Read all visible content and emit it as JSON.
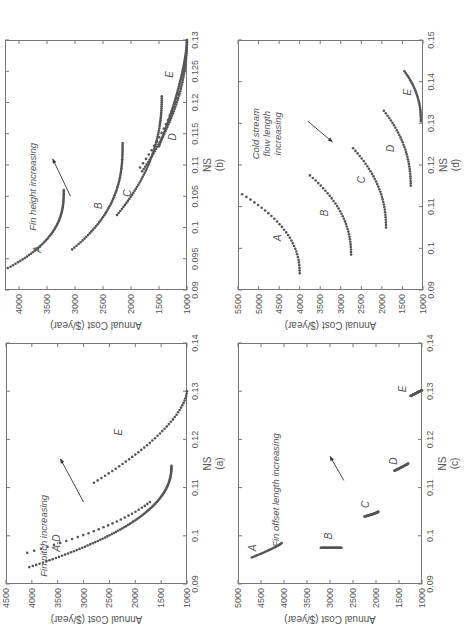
{
  "figure": {
    "rotation": "90deg counter-clockwise (page shown sideways)",
    "panels": [
      "a",
      "b",
      "c",
      "d"
    ]
  },
  "chart_data": [
    {
      "id": "a",
      "type": "scatter",
      "caption": "(a)",
      "xlabel": "NS",
      "ylabel": "Annual Cost ($/year)",
      "xlim": [
        0.09,
        0.14
      ],
      "ylim": [
        1000,
        4500
      ],
      "xticks": [
        "0.09",
        "0.1",
        "0.11",
        "0.12",
        "0.13",
        "0.14"
      ],
      "xtick_values": [
        0.09,
        0.1,
        0.11,
        0.12,
        0.13,
        0.14
      ],
      "yticks": [
        "1000",
        "1500",
        "2000",
        "2500",
        "3000",
        "3500",
        "4000",
        "4500"
      ],
      "ytick_values": [
        1000,
        1500,
        2000,
        2500,
        3000,
        3500,
        4000,
        4500
      ],
      "annotation": {
        "text": "Fin pitch increasing",
        "x": 0.1,
        "y": 3700,
        "arrow_from": [
          0.107,
          3000
        ],
        "arrow_to": [
          0.116,
          3450
        ]
      },
      "series": [
        {
          "name": "A-D",
          "label_pos": [
            0.0985,
            3450
          ],
          "x_start": 0.0935,
          "y_start": 4050,
          "x_end": 0.1145,
          "y_end": 1300,
          "curvature": 2.2,
          "n": 90,
          "spread": 0.003
        },
        {
          "name": "E",
          "label_pos": [
            0.1215,
            2250
          ],
          "x_start": 0.111,
          "y_start": 2800,
          "x_end": 0.13,
          "y_end": 1000,
          "curvature": 1.6,
          "n": 40,
          "spread": 0
        }
      ],
      "grid": false,
      "legend": "none (inline italic labels)"
    },
    {
      "id": "b",
      "type": "scatter",
      "caption": "(b)",
      "xlabel": "NS",
      "ylabel": "Annual Cost ($/year)",
      "xlim": [
        0.09,
        0.13
      ],
      "ylim": [
        1000,
        4250
      ],
      "xticks": [
        "0.09",
        "0.095",
        "0.1",
        "0.105",
        "0.11",
        "0.115",
        "0.12",
        "0.125",
        "0.13"
      ],
      "xtick_values": [
        0.09,
        0.095,
        0.1,
        0.105,
        0.11,
        0.115,
        0.12,
        0.125,
        0.13
      ],
      "yticks": [
        "1000",
        "1500",
        "2000",
        "2500",
        "3000",
        "3500",
        "4000"
      ],
      "ytick_values": [
        1000,
        1500,
        2000,
        2500,
        3000,
        3500,
        4000
      ],
      "annotation": {
        "text": "Fin height increasing",
        "x": 0.1065,
        "y": 3700,
        "arrow_from": [
          0.105,
          3080
        ],
        "arrow_to": [
          0.111,
          3400
        ]
      },
      "series": [
        {
          "name": "A",
          "label_pos": [
            0.0965,
            3600
          ],
          "x_start": 0.0935,
          "y_start": 4200,
          "x_end": 0.106,
          "y_end": 3200,
          "curvature": 2.6,
          "n": 55,
          "spread": 0
        },
        {
          "name": "B",
          "label_pos": [
            0.1035,
            2520
          ],
          "x_start": 0.0965,
          "y_start": 3050,
          "x_end": 0.1135,
          "y_end": 2150,
          "curvature": 2.6,
          "n": 60,
          "spread": 0
        },
        {
          "name": "C",
          "label_pos": [
            0.1055,
            2000
          ],
          "x_start": 0.102,
          "y_start": 2250,
          "x_end": 0.121,
          "y_end": 1450,
          "curvature": 2.2,
          "n": 60,
          "spread": 0
        },
        {
          "name": "D",
          "label_pos": [
            0.1145,
            1200
          ],
          "x_start": 0.109,
          "y_start": 1800,
          "x_end": 0.13,
          "y_end": 1000,
          "curvature": 2.0,
          "n": 60,
          "spread": 0.0006
        },
        {
          "name": "E",
          "label_pos": [
            0.1245,
            1250
          ],
          "x_start": 0.113,
          "y_start": 1500,
          "x_end": 0.13,
          "y_end": 1000,
          "curvature": 1.5,
          "n": 60,
          "spread": 0
        }
      ],
      "grid": false,
      "legend": "none (inline italic labels)"
    },
    {
      "id": "c",
      "type": "scatter",
      "caption": "(c)",
      "xlabel": "NS",
      "ylabel": "Annual Cost ($/year)",
      "xlim": [
        0.09,
        0.14
      ],
      "ylim": [
        1000,
        5000
      ],
      "xticks": [
        "0.09",
        "0.1",
        "0.11",
        "0.12",
        "0.13",
        "0.14"
      ],
      "xtick_values": [
        0.09,
        0.1,
        0.11,
        0.12,
        0.13,
        0.14
      ],
      "yticks": [
        "1000",
        "1500",
        "2000",
        "2500",
        "3000",
        "3500",
        "4000",
        "4500",
        "5000"
      ],
      "ytick_values": [
        1000,
        1500,
        2000,
        2500,
        3000,
        3500,
        4000,
        4500,
        5000
      ],
      "annotation": {
        "text": "Fin offset length increasing",
        "x": 0.1095,
        "y": 4100,
        "arrow_from": [
          0.1115,
          2700
        ],
        "arrow_to": [
          0.1165,
          3000
        ]
      },
      "series": [
        {
          "name": "A",
          "label_pos": [
            0.0975,
            4600
          ],
          "x_start": 0.0955,
          "y_start": 4700,
          "x_end": 0.0985,
          "y_end": 4050,
          "curvature": 1.2,
          "n": 22,
          "spread": 0
        },
        {
          "name": "B",
          "label_pos": [
            0.1,
            2950
          ],
          "x_start": 0.0975,
          "y_start": 3200,
          "x_end": 0.0975,
          "y_end": 2750,
          "curvature": 1.0,
          "n": 30,
          "spread": 0
        },
        {
          "name": "C",
          "label_pos": [
            0.1065,
            2150
          ],
          "x_start": 0.104,
          "y_start": 2250,
          "x_end": 0.105,
          "y_end": 1950,
          "curvature": 1.3,
          "n": 30,
          "spread": 0
        },
        {
          "name": "D",
          "label_pos": [
            0.1155,
            1550
          ],
          "x_start": 0.1135,
          "y_start": 1600,
          "x_end": 0.115,
          "y_end": 1300,
          "curvature": 1.1,
          "n": 30,
          "spread": 0
        },
        {
          "name": "E",
          "label_pos": [
            0.1305,
            1350
          ],
          "x_start": 0.129,
          "y_start": 1250,
          "x_end": 0.1302,
          "y_end": 1000,
          "curvature": 1.0,
          "n": 30,
          "spread": 0
        }
      ],
      "grid": false,
      "legend": "none (inline italic labels)"
    },
    {
      "id": "d",
      "type": "scatter",
      "caption": "(d)",
      "xlabel": "NS",
      "ylabel": "Annual Cost ($/year)",
      "xlim": [
        0.09,
        0.15
      ],
      "ylim": [
        1000,
        5500
      ],
      "xticks": [
        "0.09",
        "0.1",
        "0.11",
        "0.12",
        "0.13",
        "0.14",
        "0.15"
      ],
      "xtick_values": [
        0.09,
        0.1,
        0.11,
        0.12,
        0.13,
        0.14,
        0.15
      ],
      "yticks": [
        "1000",
        "1500",
        "2000",
        "2500",
        "3000",
        "3500",
        "4000",
        "4500",
        "5000",
        "5500"
      ],
      "ytick_values": [
        1000,
        1500,
        2000,
        2500,
        3000,
        3500,
        4000,
        4500,
        5000,
        5500
      ],
      "annotation": {
        "text": [
          "Cold stream",
          "flow length",
          "increasing"
        ],
        "x": 0.1275,
        "y": 5000,
        "arrow_from": [
          0.1305,
          3800
        ],
        "arrow_to": [
          0.1255,
          3200
        ]
      },
      "series": [
        {
          "name": "A",
          "label_pos": [
            0.1025,
            4450
          ],
          "x_min": 0.094,
          "y_min": 4000,
          "x_end": 0.113,
          "y_end": 5400,
          "n": 30
        },
        {
          "name": "B",
          "label_pos": [
            0.1085,
            3300
          ],
          "x_min": 0.0985,
          "y_min": 2750,
          "x_end": 0.1175,
          "y_end": 3750,
          "n": 32
        },
        {
          "name": "C",
          "label_pos": [
            0.1165,
            2400
          ],
          "x_min": 0.105,
          "y_min": 1900,
          "x_end": 0.124,
          "y_end": 2700,
          "n": 32
        },
        {
          "name": "D",
          "label_pos": [
            0.124,
            1700
          ],
          "x_min": 0.115,
          "y_min": 1300,
          "x_end": 0.133,
          "y_end": 1950,
          "n": 32
        },
        {
          "name": "E",
          "label_pos": [
            0.1375,
            1280
          ],
          "x_min": 0.1305,
          "y_min": 1050,
          "x_end": 0.1425,
          "y_end": 1450,
          "n": 30
        }
      ],
      "grid": false,
      "legend": "none (inline italic labels)"
    }
  ],
  "layout": {
    "a": {
      "left": 51,
      "top": 6,
      "width": 241,
      "height": 181
    },
    "b": {
      "left": 345,
      "top": 5,
      "width": 250,
      "height": 182
    },
    "c": {
      "left": 51,
      "top": 238,
      "width": 241,
      "height": 184
    },
    "d": {
      "left": 345,
      "top": 238,
      "width": 250,
      "height": 185
    }
  },
  "colors": {
    "marker": "#555555",
    "axis": "#777777",
    "text": "#555555"
  }
}
